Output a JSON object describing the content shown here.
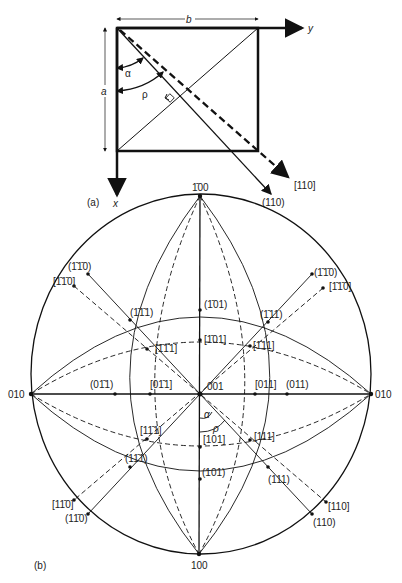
{
  "panel_a": {
    "label": "(a)",
    "dim_b": "b",
    "dim_a": "a",
    "axis_y": "y",
    "axis_x": "x",
    "angle_alpha": "α",
    "angle_rho": "ρ",
    "direction_label": "[110]",
    "plane_label": "(110)"
  },
  "panel_b": {
    "label": "(b)",
    "poles": {
      "top": "1̄00",
      "bottom": "100",
      "left": "010",
      "right": "010",
      "center": "001"
    },
    "labels": {
      "p_m1m10_ul": "(1̄1̄0)",
      "d_m1m10_ul": "[1̄1̄0]",
      "p_m1m10_ur": "(1̄1̄0)",
      "d_m1m10_ur": "[1̄1̄0]",
      "p_m101": "(1̄01)",
      "d_m101": "[1̄01]",
      "p_m1m11": "(1̄1̄1)",
      "d_m1m11": "[1̄1̄1]",
      "p_m111": "(1̄11)",
      "d_m111": "[1̄11]",
      "p_0m11": "(01̄1)",
      "d_0m11": "[01̄1]",
      "d_011": "[011]",
      "p_011": "(011)",
      "d_1m11": "[11̄1]",
      "p_1m11": "(11̄1)",
      "d_101": "[101]",
      "p_101": "(101)",
      "d_111": "[111]",
      "p_111": "(111)",
      "d_1m10": "[11̄0]",
      "p_1m10": "(11̄0)",
      "d_110": "[110]",
      "p_110": "(110)",
      "alpha": "α",
      "rho": "ρ"
    }
  }
}
